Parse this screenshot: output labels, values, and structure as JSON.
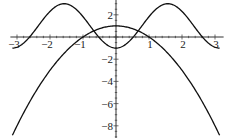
{
  "chart_data": {
    "type": "line",
    "title": "",
    "xlabel": "",
    "ylabel": "",
    "xlim": [
      -3.14,
      3.14
    ],
    "ylim": [
      -9,
      3.3
    ],
    "grid": false,
    "x_ticks": [
      "-3",
      "-2",
      "-1",
      "1",
      "2",
      "3"
    ],
    "y_ticks": [
      "2",
      "-2",
      "-4",
      "-6",
      "-8"
    ],
    "series": [
      {
        "name": "1 - 2cos(2x)",
        "x": [
          -3.14,
          -2.36,
          -1.57,
          -0.79,
          0,
          0.79,
          1.57,
          2.36,
          3.14
        ],
        "values": [
          -1,
          1,
          3,
          1,
          -1,
          1,
          3,
          1,
          -1
        ]
      },
      {
        "name": "1 - x^2",
        "x": [
          -3.14,
          -2,
          -1,
          0,
          1,
          2,
          3.14
        ],
        "values": [
          -8.87,
          -3,
          0,
          1,
          0,
          -3,
          -8.87
        ]
      }
    ]
  }
}
